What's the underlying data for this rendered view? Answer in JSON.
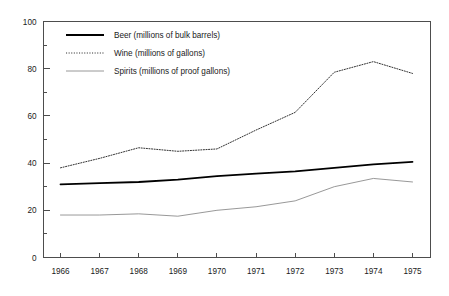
{
  "chart_data": {
    "type": "line",
    "title": "",
    "subtitle": "",
    "xlabel": "",
    "ylabel": "",
    "x": [
      1966,
      1967,
      1968,
      1969,
      1970,
      1971,
      1972,
      1973,
      1974,
      1975
    ],
    "categories": [
      "1966",
      "1967",
      "1968",
      "1969",
      "1970",
      "1971",
      "1972",
      "1973",
      "1974",
      "1975"
    ],
    "xlim": [
      1965.5,
      1975.6
    ],
    "ylim": [
      0,
      100
    ],
    "y_major_ticks": [
      0,
      20,
      40,
      60,
      80,
      100
    ],
    "y_minor_ticks": [
      10,
      30,
      50,
      70,
      90
    ],
    "y_tick_labels": [
      "0",
      "20",
      "40",
      "60",
      "80",
      "100"
    ],
    "grid": false,
    "legend_position": "top-left-inside",
    "series": [
      {
        "name": "Beer (millions of bulk barrels)",
        "style": "solid",
        "color": "#000000",
        "width": 1.8,
        "values": [
          31,
          31.5,
          32,
          33,
          34.5,
          35.5,
          36.5,
          38,
          39.5,
          40.5
        ]
      },
      {
        "name": "Wine (millions of gallons)",
        "style": "dotted",
        "color": "#333333",
        "width": 1.0,
        "values": [
          38,
          42,
          46.5,
          45,
          46,
          54,
          61.5,
          78.5,
          83,
          78
        ]
      },
      {
        "name": "Spirits (millions of proof gallons)",
        "style": "thin-solid",
        "color": "#8c8c8c",
        "width": 0.9,
        "values": [
          18,
          18,
          18.5,
          17.5,
          20,
          21.5,
          24,
          30,
          33.5,
          32
        ]
      }
    ]
  },
  "legend": {
    "items": [
      {
        "label": "Beer (millions of bulk barrels)"
      },
      {
        "label": "Wine (millions of gallons)"
      },
      {
        "label": "Spirits (millions of proof gallons)"
      }
    ]
  },
  "axis": {
    "y_labels": [
      "100",
      "80",
      "60",
      "40",
      "20",
      "0"
    ],
    "x_labels": [
      "1966",
      "1967",
      "1968",
      "1969",
      "1970",
      "1971",
      "1972",
      "1973",
      "1974",
      "1975"
    ]
  },
  "colors": {
    "frame": "#4d4d4d",
    "beer": "#000000",
    "wine": "#333333",
    "spirits": "#8c8c8c",
    "text": "#1a1a1a",
    "background": "#ffffff"
  }
}
